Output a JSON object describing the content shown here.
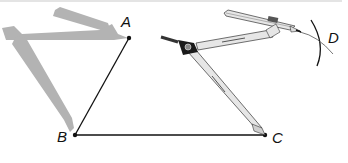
{
  "figure": {
    "points": [
      {
        "label": "A",
        "x": 129,
        "y": 38
      },
      {
        "label": "B",
        "x": 75,
        "y": 135
      },
      {
        "label": "C",
        "x": 265,
        "y": 135
      },
      {
        "label": "D",
        "x": 318,
        "y": 44
      }
    ],
    "segments": [
      {
        "from": "A",
        "to": "B"
      },
      {
        "from": "B",
        "to": "C"
      }
    ],
    "arc_label": "D",
    "colors": {
      "line": "#111111",
      "ghost_compass": "#b3b3b3",
      "compass_body": "#e6e6e6",
      "compass_outline": "#333333",
      "hinge": "#1a1a1a"
    }
  }
}
